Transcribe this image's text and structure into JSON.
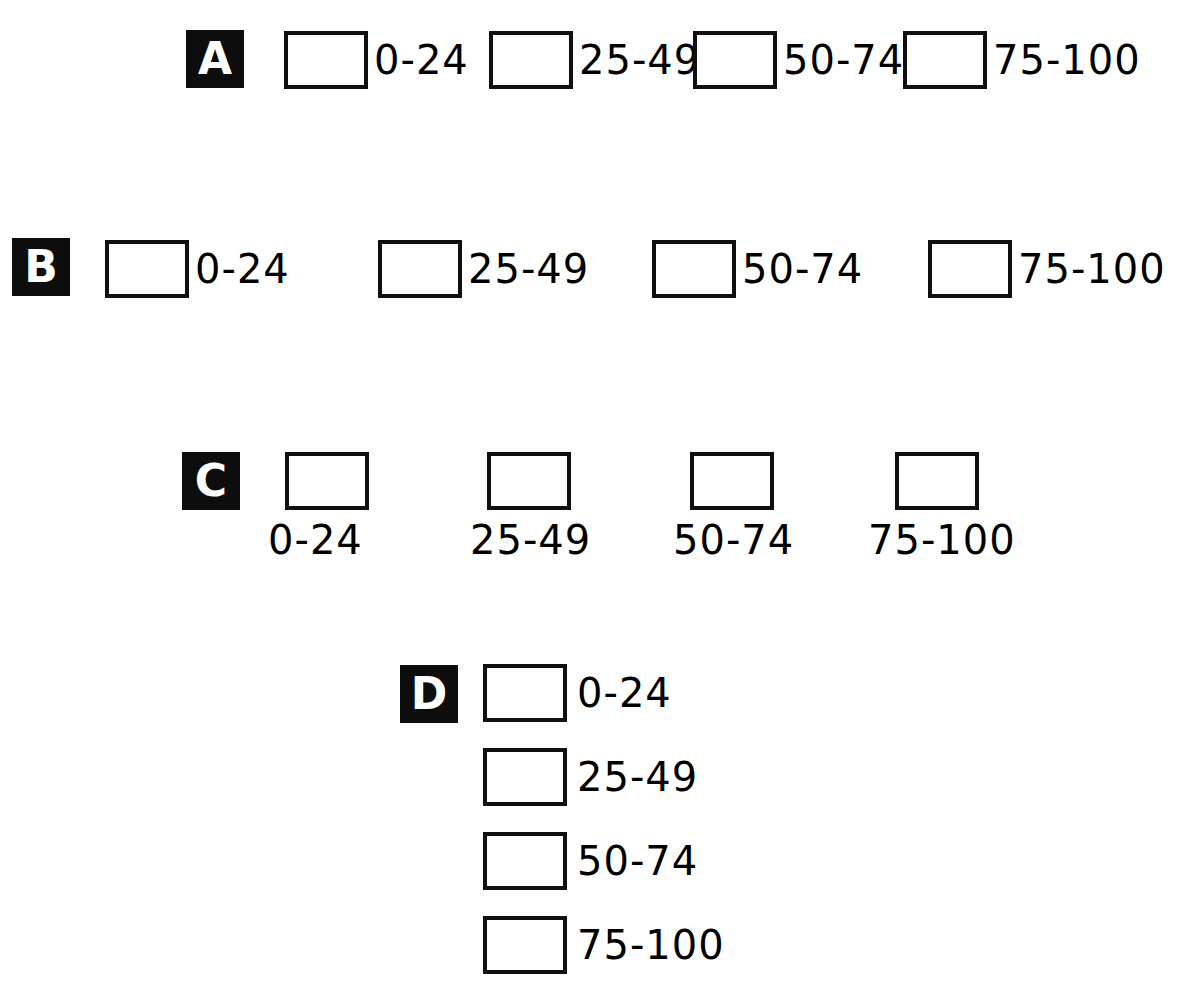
{
  "figure": {
    "background_color": "#ffffff",
    "ink_color": "#000000",
    "badge_background": "#0d0d0d",
    "badge_text_color": "#ffffff",
    "class_labels": [
      "0-24",
      "25-49",
      "50-74",
      "75-100"
    ]
  },
  "panels": [
    {
      "id": "A",
      "badge": "A",
      "label_position": "right",
      "orientation": "horizontal",
      "badge_xy": [
        186,
        30
      ],
      "entries": [
        {
          "label": "0-24",
          "swatch_xy": [
            284,
            31
          ],
          "label_xy": [
            374,
            31
          ]
        },
        {
          "label": "25-49",
          "swatch_xy": [
            489,
            31
          ],
          "label_xy": [
            579,
            31
          ]
        },
        {
          "label": "50-74",
          "swatch_xy": [
            693,
            31
          ],
          "label_xy": [
            783,
            31
          ]
        },
        {
          "label": "75-100",
          "swatch_xy": [
            903,
            31
          ],
          "label_xy": [
            993,
            31
          ]
        }
      ]
    },
    {
      "id": "B",
      "badge": "B",
      "label_position": "right",
      "orientation": "horizontal",
      "badge_xy": [
        12,
        238
      ],
      "entries": [
        {
          "label": "0-24",
          "swatch_xy": [
            105,
            240
          ],
          "label_xy": [
            195,
            240
          ]
        },
        {
          "label": "25-49",
          "swatch_xy": [
            378,
            240
          ],
          "label_xy": [
            468,
            240
          ]
        },
        {
          "label": "50-74",
          "swatch_xy": [
            652,
            240
          ],
          "label_xy": [
            742,
            240
          ]
        },
        {
          "label": "75-100",
          "swatch_xy": [
            928,
            240
          ],
          "label_xy": [
            1018,
            240
          ]
        }
      ]
    },
    {
      "id": "C",
      "badge": "C",
      "label_position": "below",
      "orientation": "horizontal",
      "badge_xy": [
        182,
        452
      ],
      "entries": [
        {
          "label": "0-24",
          "swatch_xy": [
            285,
            452
          ],
          "label_xy": [
            268,
            520
          ]
        },
        {
          "label": "25-49",
          "swatch_xy": [
            487,
            452
          ],
          "label_xy": [
            470,
            520
          ]
        },
        {
          "label": "50-74",
          "swatch_xy": [
            690,
            452
          ],
          "label_xy": [
            673,
            520
          ]
        },
        {
          "label": "75-100",
          "swatch_xy": [
            895,
            452
          ],
          "label_xy": [
            868,
            520
          ]
        }
      ]
    },
    {
      "id": "D",
      "badge": "D",
      "label_position": "right",
      "orientation": "vertical",
      "badge_xy": [
        400,
        665
      ],
      "entries": [
        {
          "label": "0-24",
          "swatch_xy": [
            483,
            664
          ],
          "label_xy": [
            577,
            664
          ]
        },
        {
          "label": "25-49",
          "swatch_xy": [
            483,
            748
          ],
          "label_xy": [
            577,
            748
          ]
        },
        {
          "label": "50-74",
          "swatch_xy": [
            483,
            832
          ],
          "label_xy": [
            577,
            832
          ]
        },
        {
          "label": "75-100",
          "swatch_xy": [
            483,
            916
          ],
          "label_xy": [
            577,
            916
          ]
        }
      ]
    }
  ]
}
